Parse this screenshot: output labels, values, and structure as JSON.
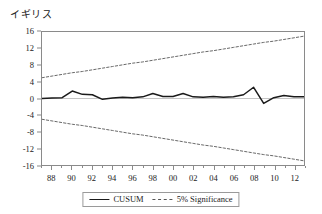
{
  "chart_data": {
    "type": "line",
    "title": "イギリス",
    "xlabel": "",
    "ylabel": "",
    "ylim": [
      -16,
      16
    ],
    "xlim": [
      1987,
      2013
    ],
    "grid": false,
    "legend_position": "bottom-center",
    "yticks": [
      "16",
      "12",
      "8",
      "4",
      "0",
      "-4",
      "-8",
      "-12",
      "-16"
    ],
    "ytick_values": [
      16,
      12,
      8,
      4,
      0,
      -4,
      -8,
      -12,
      -16
    ],
    "xticks": [
      "88",
      "90",
      "92",
      "94",
      "96",
      "98",
      "00",
      "02",
      "04",
      "06",
      "08",
      "10",
      "12"
    ],
    "xtick_values": [
      1988,
      1990,
      1992,
      1994,
      1996,
      1998,
      2000,
      2002,
      2004,
      2006,
      2008,
      2010,
      2012
    ],
    "x": [
      1987,
      1988,
      1989,
      1990,
      1991,
      1992,
      1993,
      1994,
      1995,
      1996,
      1997,
      1998,
      1999,
      2000,
      2001,
      2002,
      2003,
      2004,
      2005,
      2006,
      2007,
      2008,
      2009,
      2010,
      2011,
      2012,
      2013
    ],
    "series": [
      {
        "name": "CUSUM",
        "style": "solid",
        "color": "#1a1a1a",
        "values": [
          0.0,
          0.1,
          0.2,
          1.8,
          1.0,
          0.9,
          -0.2,
          0.1,
          0.3,
          0.2,
          0.4,
          1.2,
          0.5,
          0.5,
          1.2,
          0.4,
          0.3,
          0.5,
          0.3,
          0.4,
          0.9,
          2.7,
          -1.2,
          0.2,
          0.7,
          0.4,
          0.4
        ]
      },
      {
        "name": "5% Significance",
        "style": "dashed",
        "color": "#555555",
        "values": [
          5.0,
          5.4,
          5.8,
          6.2,
          6.5,
          6.9,
          7.3,
          7.7,
          8.1,
          8.5,
          8.8,
          9.2,
          9.6,
          10.0,
          10.4,
          10.8,
          11.2,
          11.5,
          11.9,
          12.3,
          12.7,
          13.1,
          13.5,
          13.8,
          14.2,
          14.6,
          15.0
        ]
      },
      {
        "name": "5% Significance",
        "style": "dashed",
        "color": "#555555",
        "values": [
          -5.0,
          -5.4,
          -5.8,
          -6.2,
          -6.5,
          -6.9,
          -7.3,
          -7.7,
          -8.1,
          -8.5,
          -8.8,
          -9.2,
          -9.6,
          -10.0,
          -10.4,
          -10.8,
          -11.2,
          -11.5,
          -11.9,
          -12.3,
          -12.7,
          -13.1,
          -13.5,
          -13.8,
          -14.2,
          -14.6,
          -15.0
        ]
      }
    ]
  },
  "legend": {
    "items": [
      {
        "label": "CUSUM",
        "style": "solid"
      },
      {
        "label": "5% Significance",
        "style": "dashed"
      }
    ]
  }
}
